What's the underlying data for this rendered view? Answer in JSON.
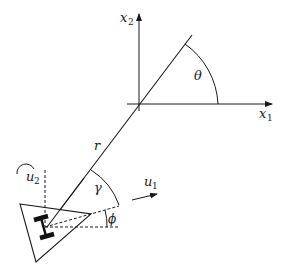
{
  "diagram": {
    "type": "unicycle-robot-polar-coordinates",
    "axes": {
      "x_axis_label": {
        "base": "x",
        "sub": "1"
      },
      "y_axis_label": {
        "base": "x",
        "sub": "2"
      }
    },
    "angles": {
      "theta": "θ",
      "gamma": "γ",
      "phi": "ϕ"
    },
    "distance_label": "r",
    "inputs": {
      "u1": {
        "base": "u",
        "sub": "1"
      },
      "u2": {
        "base": "u",
        "sub": "2"
      }
    },
    "colors": {
      "stroke": "#1a1a1a",
      "wheel": "#111111",
      "background": "#ffffff"
    }
  }
}
